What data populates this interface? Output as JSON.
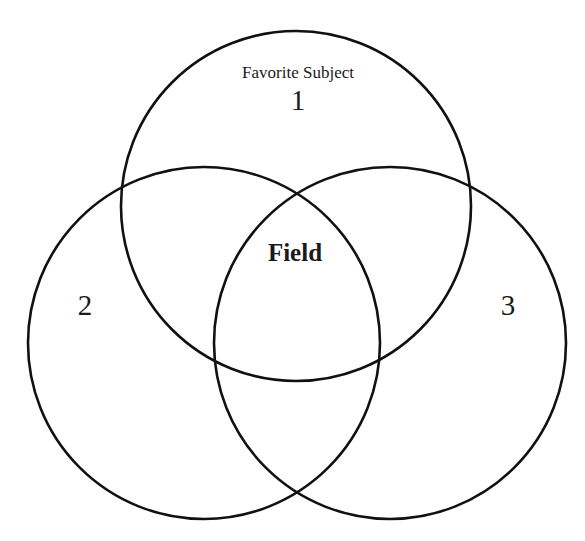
{
  "diagram": {
    "type": "venn",
    "circles": [
      {
        "id": "1",
        "label": "1",
        "caption": "Favorite Subject"
      },
      {
        "id": "2",
        "label": "2"
      },
      {
        "id": "3",
        "label": "3"
      }
    ],
    "center_label": "Field",
    "stroke_color": "#111111",
    "background": "#ffffff"
  }
}
